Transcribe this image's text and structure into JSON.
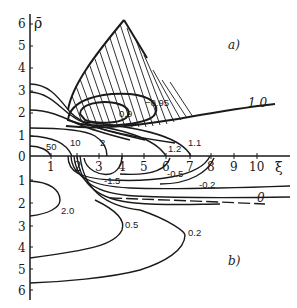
{
  "figure": {
    "axes": {
      "y_axis_label": "ρ̄",
      "x_axis_label": "ξ",
      "y_ticks_upper": [
        "6",
        "5",
        "4",
        "3",
        "2",
        "1"
      ],
      "y_tick_zero": "0",
      "y_ticks_lower": [
        "1",
        "2",
        "3",
        "4",
        "5",
        "6"
      ],
      "x_ticks": [
        "1",
        "2",
        "3",
        "4",
        "5",
        "6",
        "7",
        "8",
        "9",
        "10"
      ]
    },
    "panel_a": {
      "label": "a)",
      "contour_labels": {
        "c50": "50",
        "c10": "10",
        "c2": "2",
        "c1_2": "1.2",
        "c1_1": "1.1",
        "c0_9": "0.9",
        "cm0_95": "−0.95",
        "c1_0": "1.0"
      }
    },
    "panel_b": {
      "label": "b)",
      "contour_labels": {
        "cm1_5": "-1.5",
        "cm0_5": "-0.5",
        "cm0_2": "-0.2",
        "c0": "0",
        "c2_0": "2.0",
        "c0_5": "0.5",
        "c0_2": "0.2"
      }
    }
  }
}
